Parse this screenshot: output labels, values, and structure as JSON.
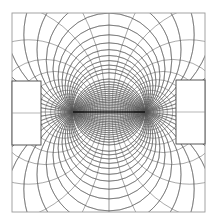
{
  "figure": {
    "title": "Bipolar coordinate mesh between two rectangular electrodes",
    "width": 221,
    "height": 222,
    "background": "#ffffff",
    "line_color": "#555555",
    "frame_color": "#9a9a9a",
    "segment_color": "#111111"
  },
  "frame": {
    "x0": 12,
    "y0": 13,
    "x1": 205,
    "y1": 212
  },
  "foci": [
    {
      "name": "left-focus",
      "x": 73,
      "y": 112
    },
    {
      "name": "right-focus",
      "x": 145,
      "y": 112
    }
  ],
  "electrodes": [
    {
      "name": "left-electrode",
      "x0": 12,
      "y0": 81,
      "x1": 41,
      "y1": 145,
      "mid_y": 113
    },
    {
      "name": "right-electrode",
      "x0": 176,
      "y0": 80,
      "x1": 205,
      "y1": 144,
      "mid_y": 112
    }
  ],
  "mesh": {
    "tau_count": 14,
    "tau_step": 0.16,
    "sigma_count": 36,
    "center_line_x": 109
  }
}
